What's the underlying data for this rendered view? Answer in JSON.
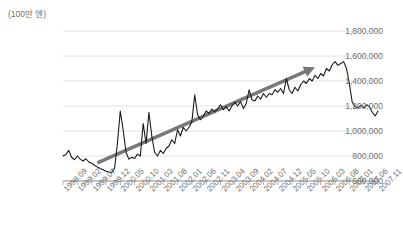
{
  "chart_data": {
    "type": "line",
    "title": "",
    "xlabel": "",
    "ylabel": "",
    "unit_label": "(100만 엔)",
    "ylim": [
      600000,
      1800000
    ],
    "ytick_values": [
      1800000,
      1600000,
      1400000,
      1200000,
      1000000,
      800000,
      600000
    ],
    "ytick_labels": [
      "1,800,000",
      "1,600,000",
      "1,400,000",
      "1,200,000",
      "1,000,000",
      "800,000",
      "600,000"
    ],
    "grid": true,
    "legend": null,
    "xtick_labels": [
      "1998.09",
      "1999.02",
      "1999.07",
      "1999.12",
      "2000.05",
      "2000.10",
      "2001.03",
      "2001.08",
      "2002.01",
      "2002.06",
      "2002.11",
      "2003.04",
      "2003.09",
      "2004.02",
      "2004.07",
      "2004.12",
      "2005.05",
      "2005.10",
      "2006.03",
      "2006.08",
      "2007.01",
      "2007.06",
      "2007.11"
    ],
    "xtick_step_months": 5,
    "x_start": "1998.09",
    "x_end": "2007.11",
    "series": [
      {
        "name": "monthly-value",
        "color": "#1a1a1a",
        "x": [
          "1998.09",
          "1998.10",
          "1998.11",
          "1998.12",
          "1999.01",
          "1999.02",
          "1999.03",
          "1999.04",
          "1999.05",
          "1999.06",
          "1999.07",
          "1999.08",
          "1999.09",
          "1999.10",
          "1999.11",
          "1999.12",
          "2000.01",
          "2000.02",
          "2000.03",
          "2000.04",
          "2000.05",
          "2000.06",
          "2000.07",
          "2000.08",
          "2000.09",
          "2000.10",
          "2000.11",
          "2000.12",
          "2001.01",
          "2001.02",
          "2001.03",
          "2001.04",
          "2001.05",
          "2001.06",
          "2001.07",
          "2001.08",
          "2001.09",
          "2001.10",
          "2001.11",
          "2001.12",
          "2002.01",
          "2002.02",
          "2002.03",
          "2002.04",
          "2002.05",
          "2002.06",
          "2002.07",
          "2002.08",
          "2002.09",
          "2002.10",
          "2002.11",
          "2002.12",
          "2003.01",
          "2003.02",
          "2003.03",
          "2003.04",
          "2003.05",
          "2003.06",
          "2003.07",
          "2003.08",
          "2003.09",
          "2003.10",
          "2003.11",
          "2003.12",
          "2004.01",
          "2004.02",
          "2004.03",
          "2004.04",
          "2004.05",
          "2004.06",
          "2004.07",
          "2004.08",
          "2004.09",
          "2004.10",
          "2004.11",
          "2004.12",
          "2005.01",
          "2005.02",
          "2005.03",
          "2005.04",
          "2005.05",
          "2005.06",
          "2005.07",
          "2005.08",
          "2005.09",
          "2005.10",
          "2005.11",
          "2005.12",
          "2006.01",
          "2006.02",
          "2006.03",
          "2006.04",
          "2006.05",
          "2006.06",
          "2006.07",
          "2006.08",
          "2006.09",
          "2006.10",
          "2006.11",
          "2006.12",
          "2007.01",
          "2007.02",
          "2007.03",
          "2007.04",
          "2007.05",
          "2007.06",
          "2007.07",
          "2007.08",
          "2007.09",
          "2007.10",
          "2007.11"
        ],
        "values": [
          800000,
          812000,
          845000,
          790000,
          770000,
          800000,
          775000,
          760000,
          778000,
          752000,
          742000,
          726000,
          712000,
          700000,
          690000,
          678000,
          672000,
          668000,
          700000,
          900000,
          1160000,
          1010000,
          830000,
          775000,
          790000,
          780000,
          815000,
          800000,
          1060000,
          900000,
          1150000,
          960000,
          830000,
          800000,
          845000,
          820000,
          860000,
          880000,
          930000,
          900000,
          1010000,
          960000,
          1030000,
          1000000,
          1030000,
          1075000,
          1290000,
          1130000,
          1090000,
          1120000,
          1160000,
          1140000,
          1175000,
          1150000,
          1180000,
          1210000,
          1170000,
          1195000,
          1160000,
          1200000,
          1230000,
          1200000,
          1235000,
          1180000,
          1220000,
          1330000,
          1250000,
          1240000,
          1280000,
          1255000,
          1300000,
          1270000,
          1300000,
          1290000,
          1330000,
          1310000,
          1340000,
          1300000,
          1420000,
          1330000,
          1300000,
          1350000,
          1320000,
          1370000,
          1400000,
          1380000,
          1420000,
          1400000,
          1445000,
          1420000,
          1460000,
          1440000,
          1500000,
          1480000,
          1530000,
          1555000,
          1525000,
          1540000,
          1555000,
          1500000,
          1380000,
          1230000,
          1195000,
          1185000,
          1205000,
          1185000,
          1210000,
          1195000,
          1150000,
          1120000,
          1160000
        ]
      }
    ],
    "annotations": [
      {
        "name": "trend-arrow",
        "type": "arrow",
        "color": "#787878",
        "from": {
          "x": "1999.09",
          "y": 745000
        },
        "to": {
          "x": "2006.01",
          "y": 1510000
        },
        "description": "upward trend arrow"
      }
    ]
  }
}
